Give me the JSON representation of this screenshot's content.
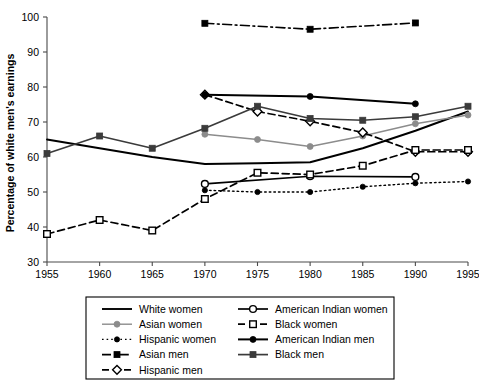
{
  "chart_data": {
    "type": "line",
    "title": "",
    "xlabel": "",
    "ylabel": "Percentage of white men's earnings",
    "xlim": [
      1955,
      1995
    ],
    "ylim": [
      30,
      100
    ],
    "grid": false,
    "legend_position": "bottom",
    "x_ticks": [
      "1955",
      "1960",
      "1965",
      "1970",
      "1975",
      "1980",
      "1985",
      "1990",
      "1995"
    ],
    "y_ticks": [
      "30",
      "40",
      "50",
      "60",
      "70",
      "80",
      "90",
      "100"
    ],
    "x": [
      1955,
      1960,
      1965,
      1970,
      1975,
      1980,
      1985,
      1990,
      1995
    ],
    "series": [
      {
        "name": "White women",
        "key": "white_women",
        "marker": "none",
        "dash": "none",
        "color": "#000000",
        "width": 1.9,
        "x": [
          1955,
          1960,
          1965,
          1970,
          1975,
          1980,
          1985,
          1990,
          1995
        ],
        "values": [
          65.0,
          62.5,
          60.0,
          58.0,
          58.2,
          58.5,
          62.5,
          67.5,
          73.0
        ]
      },
      {
        "name": "Asian women",
        "key": "asian_women",
        "marker": "circle-filled",
        "dash": "none",
        "color": "#8c8c8c",
        "width": 1.4,
        "x": [
          1970,
          1975,
          1980,
          1985,
          1990,
          1995
        ],
        "values": [
          66.5,
          65.0,
          63.0,
          66.0,
          69.5,
          72.0
        ]
      },
      {
        "name": "Hispanic women",
        "key": "hispanic_women",
        "marker": "circle-filled-small",
        "dash": "dotted",
        "color": "#000000",
        "width": 1.4,
        "x": [
          1970,
          1975,
          1980,
          1985,
          1990,
          1995
        ],
        "values": [
          50.5,
          50.0,
          50.0,
          51.5,
          52.5,
          53.0
        ]
      },
      {
        "name": "Asian men",
        "key": "asian_men",
        "marker": "square-filled",
        "dash": "dashdot",
        "color": "#000000",
        "width": 1.6,
        "x": [
          1970,
          1980,
          1990
        ],
        "values": [
          98.2,
          96.5,
          98.3
        ]
      },
      {
        "name": "Hispanic men",
        "key": "hispanic_men",
        "marker": "diamond-open",
        "dash": "dashed",
        "color": "#000000",
        "width": 1.7,
        "x": [
          1970,
          1975,
          1980,
          1985,
          1990,
          1995
        ],
        "values": [
          77.8,
          73.0,
          70.2,
          67.0,
          61.5,
          61.5
        ]
      },
      {
        "name": "American Indian women",
        "key": "american_indian_women",
        "marker": "circle-open",
        "dash": "none",
        "color": "#000000",
        "width": 1.7,
        "x": [
          1970,
          1980,
          1990
        ],
        "values": [
          52.3,
          54.5,
          54.3
        ]
      },
      {
        "name": "Black women",
        "key": "black_women",
        "marker": "square-open",
        "dash": "dashed",
        "color": "#000000",
        "width": 1.7,
        "x": [
          1955,
          1960,
          1965,
          1970,
          1975,
          1980,
          1985,
          1990,
          1995
        ],
        "values": [
          38.0,
          42.0,
          39.0,
          48.0,
          55.5,
          55.0,
          57.5,
          62.0,
          62.0
        ]
      },
      {
        "name": "American Indian men",
        "key": "american_indian_men",
        "marker": "circle-filled",
        "dash": "none",
        "color": "#000000",
        "width": 2.0,
        "x": [
          1970,
          1980,
          1990
        ],
        "values": [
          77.8,
          77.3,
          75.2
        ]
      },
      {
        "name": "Black men",
        "key": "black_men",
        "marker": "square-filled",
        "dash": "none",
        "color": "#3b3b3b",
        "width": 1.7,
        "x": [
          1955,
          1960,
          1965,
          1970,
          1975,
          1980,
          1985,
          1990,
          1995
        ],
        "values": [
          61.0,
          66.0,
          62.5,
          68.2,
          74.5,
          71.0,
          70.5,
          71.5,
          74.5
        ]
      }
    ]
  },
  "legend": {
    "column_left": [
      {
        "label": "White women",
        "key": "white_women"
      },
      {
        "label": "Asian women",
        "key": "asian_women"
      },
      {
        "label": "Hispanic women",
        "key": "hispanic_women"
      },
      {
        "label": "Asian men",
        "key": "asian_men"
      },
      {
        "label": "Hispanic men",
        "key": "hispanic_men"
      }
    ],
    "column_right": [
      {
        "label": "American Indian women",
        "key": "american_indian_women"
      },
      {
        "label": "Black women",
        "key": "black_women"
      },
      {
        "label": "American Indian men",
        "key": "american_indian_men"
      },
      {
        "label": "Black men",
        "key": "black_men"
      }
    ]
  },
  "colors": {
    "axis": "#4a4a4a",
    "text": "#000000",
    "background": "#ffffff",
    "gray_series": "#8c8c8c"
  }
}
